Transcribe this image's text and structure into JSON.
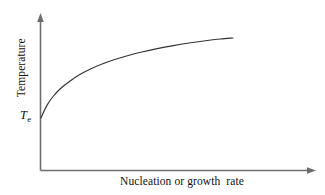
{
  "chart_data": {
    "type": "line",
    "title": "",
    "subtitle": "",
    "xlabel": "Nucleation or growth  rate",
    "ylabel": "Temperature",
    "grid": false,
    "legend": null,
    "annotations": [
      {
        "name": "equilibrium-temperature",
        "symbol": "T",
        "subscript": "e",
        "text": "Te",
        "x": 0,
        "y": 0
      }
    ],
    "axes": {
      "x_axis": {
        "arrow": true,
        "ticks": [],
        "ticklabels": [],
        "range": [
          0,
          1
        ]
      },
      "y_axis": {
        "arrow": true,
        "ticks": [],
        "ticklabels": [],
        "range": [
          0,
          1
        ]
      }
    },
    "series": [
      {
        "name": "nucleation-or-growth-rate-curve",
        "style": "solid",
        "color": "#333333",
        "x": [
          0.0,
          0.03,
          0.065,
          0.105,
          0.15,
          0.2,
          0.255,
          0.315,
          0.38,
          0.45,
          0.525,
          0.605,
          0.69,
          0.78,
          0.875,
          0.935,
          1.0
        ],
        "y": [
          0.0,
          0.155,
          0.275,
          0.375,
          0.46,
          0.54,
          0.61,
          0.672,
          0.728,
          0.779,
          0.825,
          0.867,
          0.905,
          0.94,
          0.972,
          0.988,
          1.0
        ]
      }
    ]
  },
  "colors": {
    "background": "#ffffff",
    "axis": "#6e6e6e",
    "curve": "#333333",
    "text": "#111111"
  },
  "figure": {
    "width": 325,
    "height": 195
  }
}
